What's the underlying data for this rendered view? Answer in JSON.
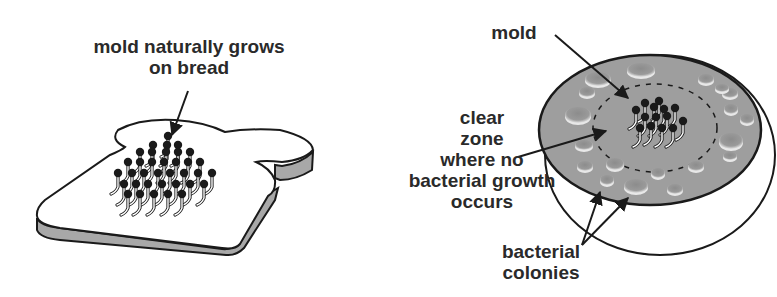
{
  "panels": [
    {
      "id": "bread",
      "caption_lines": [
        "mold naturally grows",
        "on bread"
      ]
    },
    {
      "id": "petri-dish",
      "labels": {
        "mold": "mold",
        "clear_zone_lines": [
          "clear",
          "zone",
          "where no",
          "bacterial growth",
          "occurs"
        ],
        "colonies_lines": [
          "bacterial",
          "colonies"
        ]
      }
    }
  ],
  "colors": {
    "ink": "#1a1a1a",
    "crust_gray": "#a8a8a8",
    "agar_gray": "#9a9a9a",
    "colony_gray": "#8a8a8a",
    "paper": "#ffffff"
  }
}
